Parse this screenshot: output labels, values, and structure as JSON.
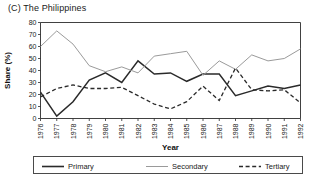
{
  "figure": {
    "title": "(C) The Philippines"
  },
  "legend": {
    "entries": [
      {
        "label": "Primary",
        "style": "solid-thick",
        "color": "#2a2a2a"
      },
      {
        "label": "Secondary",
        "style": "solid-thin",
        "color": "#9a9a9a"
      },
      {
        "label": "Tertiary",
        "style": "dashed",
        "color": "#2a2a2a"
      }
    ]
  },
  "chart_data": {
    "type": "line",
    "title": "(C) The Philippines",
    "xlabel": "Year",
    "ylabel": "Share (%)",
    "xlim": [
      1976,
      1992
    ],
    "ylim": [
      0,
      80
    ],
    "ytick_step": 10,
    "yticks": [
      0,
      10,
      20,
      30,
      40,
      50,
      60,
      70,
      80
    ],
    "grid": false,
    "legend_position": "bottom",
    "categories": [
      "1976",
      "1977",
      "1978",
      "1979",
      "1980",
      "1981",
      "1982",
      "1983",
      "1984",
      "1985",
      "1986",
      "1987",
      "1988",
      "1989",
      "1990",
      "1991",
      "1992"
    ],
    "x": [
      1976,
      1977,
      1978,
      1979,
      1980,
      1981,
      1982,
      1983,
      1984,
      1985,
      1986,
      1987,
      1988,
      1989,
      1990,
      1991,
      1992
    ],
    "series": [
      {
        "name": "Primary",
        "color": "#2a2a2a",
        "values": [
          22,
          2,
          14,
          32,
          38,
          30,
          48,
          37,
          38,
          31,
          37,
          37,
          19,
          23,
          27,
          25,
          28
        ]
      },
      {
        "name": "Secondary",
        "color": "#9a9a9a",
        "values": [
          60,
          73,
          62,
          44,
          39,
          43,
          38,
          52,
          54,
          56,
          36,
          48,
          41,
          53,
          48,
          50,
          58
        ]
      },
      {
        "name": "Tertiary",
        "color": "#2a2a2a",
        "values": [
          18,
          25,
          28,
          25,
          25,
          26,
          19,
          12,
          8,
          14,
          27,
          15,
          42,
          24,
          23,
          24,
          13
        ]
      }
    ]
  }
}
